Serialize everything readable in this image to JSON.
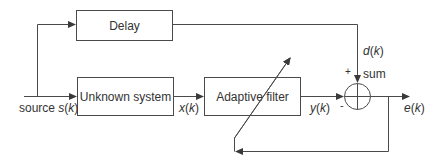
{
  "diagram": {
    "blocks": {
      "delay": "Delay",
      "unknown_system": "Unknown system",
      "adaptive_filter": "Adaptive filter"
    },
    "signals": {
      "source_prefix": "source ",
      "source_sym": "s",
      "x_sym": "x",
      "y_sym": "y",
      "d_sym": "d",
      "e_sym": "e",
      "arg_open": "(",
      "arg": "k",
      "arg_close": ")"
    },
    "sum": {
      "label": "sum",
      "plus_sign": "+",
      "minus_sign": "-"
    },
    "colors": {
      "line": "#4a4a4a",
      "text": "#333333"
    }
  }
}
